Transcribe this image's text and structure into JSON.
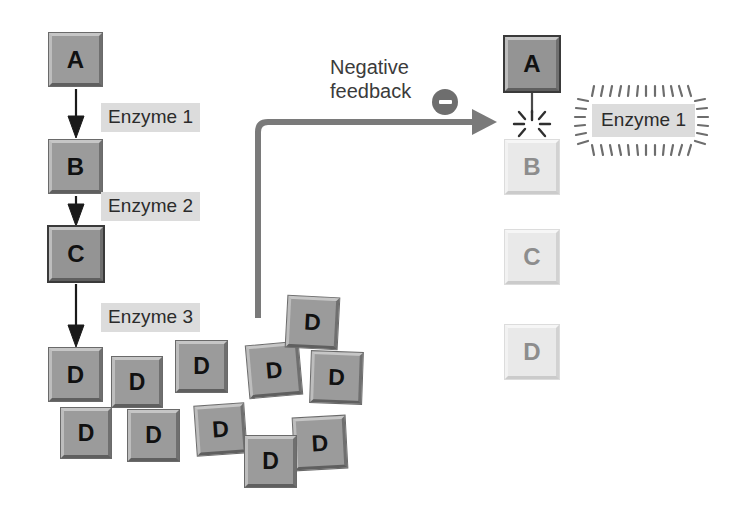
{
  "diagram": {
    "background_color": "#ffffff",
    "active_color": "#9b9b9b",
    "faded_color": "#e9e9e9",
    "arrow_color": "#7a7a7a",
    "label_bg_color": "#dcdcdc",
    "text_color": "#2b2b2b"
  },
  "left_pathway": {
    "caption": "Active pathway: A converted to B to C to D by enzymes 1, 2 and 3",
    "molecules": [
      {
        "label": "A",
        "state": "active",
        "x": 49,
        "y": 33,
        "size": 53
      },
      {
        "label": "B",
        "state": "active",
        "x": 49,
        "y": 140,
        "size": 53
      },
      {
        "label": "C",
        "state": "active",
        "x": 49,
        "y": 227,
        "size": 54
      },
      {
        "label": "D",
        "state": "active",
        "x": 49,
        "y": 348,
        "size": 53
      }
    ],
    "enzymes": [
      {
        "label": "Enzyme 1",
        "x": 101,
        "y": 103
      },
      {
        "label": "Enzyme 2",
        "x": 101,
        "y": 192
      },
      {
        "label": "Enzyme 3",
        "x": 101,
        "y": 303
      }
    ]
  },
  "product_cluster": {
    "caption": "Accumulated product D molecules",
    "label": "D",
    "count": 10,
    "molecules": [
      {
        "x": 112,
        "y": 357,
        "size": 50,
        "rot": 0
      },
      {
        "x": 176,
        "y": 341,
        "size": 51,
        "rot": 0
      },
      {
        "x": 61,
        "y": 408,
        "size": 50,
        "rot": 0
      },
      {
        "x": 128,
        "y": 410,
        "size": 51,
        "rot": 0
      },
      {
        "x": 196,
        "y": 405,
        "size": 49,
        "rot": -4
      },
      {
        "x": 248,
        "y": 344,
        "size": 52,
        "rot": -5
      },
      {
        "x": 287,
        "y": 297,
        "size": 51,
        "rot": 3
      },
      {
        "x": 294,
        "y": 417,
        "size": 52,
        "rot": -3
      },
      {
        "x": 311,
        "y": 352,
        "size": 51,
        "rot": 2
      },
      {
        "x": 245,
        "y": 436,
        "size": 51,
        "rot": 0
      }
    ]
  },
  "feedback": {
    "text_line1": "Negative",
    "text_line2": "feedback",
    "badge_symbol": "minus",
    "badge_label": "inhibition",
    "arrow_name": "negative-feedback-arrow"
  },
  "right_pathway": {
    "caption": "Inhibited pathway: Enzyme 1 blocked so B, C and D are not produced",
    "molecules": [
      {
        "label": "A",
        "state": "active",
        "x": 505,
        "y": 37,
        "size": 54
      },
      {
        "label": "B",
        "state": "faded",
        "x": 505,
        "y": 140,
        "size": 54
      },
      {
        "label": "C",
        "state": "faded",
        "x": 505,
        "y": 230,
        "size": 54
      },
      {
        "label": "D",
        "state": "faded",
        "x": 505,
        "y": 325,
        "size": 54
      }
    ],
    "blocked_symbol": "starburst",
    "blocked_label": "blocked conversion",
    "inhibited_enzyme": {
      "label": "Enzyme 1",
      "x": 592,
      "y": 107,
      "state": "inhibited"
    }
  }
}
